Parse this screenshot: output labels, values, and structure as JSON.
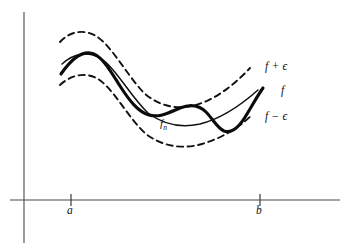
{
  "figure": {
    "background_color": "#ffffff",
    "width": 355,
    "height": 250
  },
  "axes": {
    "line_color": "#4a4a4a",
    "vertical": {
      "x": 24,
      "y_top": 12,
      "y_bottom": 243
    },
    "horizontal": {
      "y": 200,
      "x_left": 10,
      "x_right": 340
    },
    "ticks": [
      {
        "name": "a",
        "label": "a",
        "x": 71
      },
      {
        "name": "b",
        "label": "b",
        "x": 260
      }
    ]
  },
  "labels": {
    "upper_band": "f + ϵ",
    "function": "f",
    "lower_band": "f − ϵ",
    "sequence_base": "f",
    "sequence_subscript": "n",
    "tick_a": "a",
    "tick_b": "b"
  },
  "curves": [
    {
      "name": "upper-envelope",
      "label": "f + ϵ",
      "style": "dashed",
      "color": "#111111",
      "stroke_width": 1.9,
      "path": "M 60 42 C 70 31, 84 29, 96 36 C 112 46, 126 74, 144 93 C 160 107, 178 110, 196 105 C 216 99, 234 85, 250 68"
    },
    {
      "name": "lower-envelope",
      "label": "f − ϵ",
      "style": "dashed",
      "color": "#111111",
      "stroke_width": 1.9,
      "path": "M 60 85 C 72 74, 86 72, 98 79 C 114 89, 128 118, 146 134 C 162 146, 180 149, 198 145 C 218 140, 236 130, 252 115"
    },
    {
      "name": "limit-function-f",
      "label": "f",
      "style": "solid-thin",
      "color": "#111111",
      "stroke_width": 1.5,
      "path": "M 62 64 C 74 53, 88 51, 100 58 C 116 68, 130 96, 148 113 C 164 125, 182 128, 200 124 C 220 119, 240 106, 258 90"
    },
    {
      "name": "approximating-function-fn",
      "label": "f_n",
      "style": "solid-thick",
      "color": "#0b0b0b",
      "stroke_width": 3.1,
      "path": "M 61 74 C 70 61, 80 52, 90 53 C 101 54, 110 70, 120 86 C 129 100, 138 112, 149 115 C 160 118, 170 112, 180 108 C 190 104, 199 105, 206 112 C 213 119, 217 128, 224 131 C 232 134, 240 126, 247 114 C 253 104, 258 95, 263 88"
    }
  ],
  "annotations": {
    "description": "Thick oscillating curve f_n stays inside the dashed band bounded by f plus epsilon and f minus epsilon, crossing the thin smooth curve f repeatedly over the interval from a to b."
  }
}
